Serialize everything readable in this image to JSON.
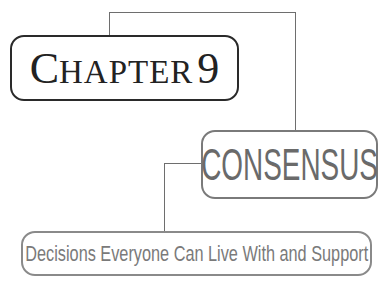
{
  "chapter": {
    "first_letter": "C",
    "rest": "HAPTER",
    "number": "9"
  },
  "title": "CONSENSUS",
  "subtitle": "Decisions Everyone Can Live With and Support",
  "colors": {
    "chapter_border": "#2a2a2a",
    "consensus_border": "#7a7a7a",
    "connector": "#6e6e6e"
  }
}
